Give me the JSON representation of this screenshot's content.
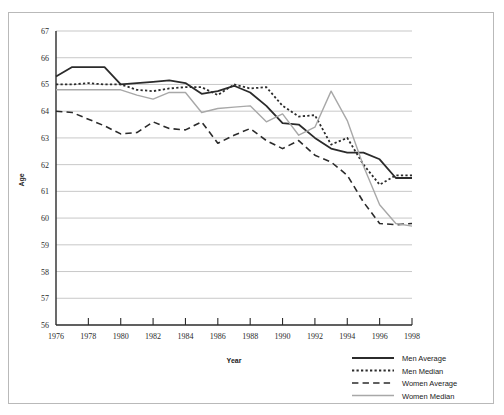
{
  "chart_data": {
    "type": "line",
    "title": "",
    "xlabel": "Year",
    "ylabel": "Age",
    "xlim": [
      1976,
      1998
    ],
    "ylim": [
      56,
      67
    ],
    "grid": true,
    "legend_position": "bottom-right",
    "x": [
      1976,
      1977,
      1978,
      1979,
      1980,
      1981,
      1982,
      1983,
      1984,
      1985,
      1986,
      1987,
      1988,
      1989,
      1990,
      1991,
      1992,
      1993,
      1994,
      1995,
      1996,
      1997,
      1998
    ],
    "xticks": [
      "1976",
      "1978",
      "1980",
      "1982",
      "1984",
      "1986",
      "1988",
      "1990",
      "1992",
      "1994",
      "1996",
      "1998"
    ],
    "yticks": [
      "56",
      "57",
      "58",
      "59",
      "60",
      "61",
      "62",
      "63",
      "64",
      "65",
      "66",
      "67"
    ],
    "series": [
      {
        "name": "Men Average",
        "style": "solid",
        "color": "#2b2b2b",
        "width": 1.8,
        "values": [
          65.3,
          65.65,
          65.65,
          65.65,
          65.0,
          65.05,
          65.1,
          65.15,
          65.05,
          64.65,
          64.75,
          64.95,
          64.7,
          64.2,
          63.55,
          63.5,
          63.0,
          62.6,
          62.45,
          62.45,
          62.2,
          61.5,
          61.5
        ]
      },
      {
        "name": "Men Median",
        "style": "dotted",
        "color": "#2b2b2b",
        "width": 1.8,
        "values": [
          65.0,
          65.0,
          65.05,
          65.0,
          65.0,
          64.8,
          64.75,
          64.85,
          64.9,
          64.9,
          64.6,
          65.0,
          64.85,
          64.9,
          64.2,
          63.8,
          63.85,
          62.75,
          63.0,
          62.0,
          61.25,
          61.6,
          61.6
        ]
      },
      {
        "name": "Women Average",
        "style": "dashed",
        "color": "#2b2b2b",
        "width": 1.6,
        "values": [
          64.0,
          63.95,
          63.7,
          63.45,
          63.15,
          63.2,
          63.6,
          63.35,
          63.3,
          63.6,
          62.8,
          63.1,
          63.35,
          62.9,
          62.6,
          62.9,
          62.35,
          62.1,
          61.6,
          60.6,
          59.8,
          59.75,
          59.8
        ]
      },
      {
        "name": "Women Median",
        "style": "solid",
        "color": "#a8a8a8",
        "width": 1.4,
        "values": [
          64.8,
          64.8,
          64.8,
          64.8,
          64.8,
          64.6,
          64.45,
          64.7,
          64.7,
          63.95,
          64.1,
          64.15,
          64.2,
          63.6,
          63.9,
          63.1,
          63.4,
          64.75,
          63.65,
          61.95,
          60.5,
          59.8,
          59.7
        ]
      }
    ]
  },
  "axes": {
    "y_title": "Age",
    "x_title": "Year"
  },
  "legend": {
    "items": [
      {
        "label": "Men Average"
      },
      {
        "label": "Men Median"
      },
      {
        "label": "Women Average"
      },
      {
        "label": "Women Median"
      }
    ]
  }
}
